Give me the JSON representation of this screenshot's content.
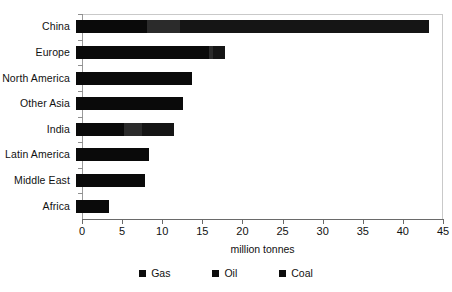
{
  "chart_data": {
    "type": "bar",
    "orientation": "horizontal",
    "stacked": true,
    "title": "",
    "xlabel": "million tonnes",
    "ylabel": "",
    "xlim": [
      0,
      45
    ],
    "xticks": [
      0,
      5,
      10,
      15,
      20,
      25,
      30,
      35,
      40,
      45
    ],
    "grid": false,
    "legend_position": "bottom",
    "categories": [
      "China",
      "Europe",
      "North America",
      "Other Asia",
      "India",
      "Latin America",
      "Middle East",
      "Africa"
    ],
    "series": [
      {
        "name": "Gas",
        "color": "#0a0a0a",
        "values": [
          8.8,
          16.6,
          14.5,
          13.4,
          6.0,
          9.1,
          8.6,
          4.1
        ]
      },
      {
        "name": "Oil",
        "color": "#2b2b2b",
        "values": [
          4.2,
          0.5,
          0.0,
          0.0,
          2.2,
          0.0,
          0.0,
          0.0
        ]
      },
      {
        "name": "Coal",
        "color": "#151515",
        "values": [
          31.0,
          1.5,
          0.0,
          0.0,
          4.0,
          0.0,
          0.0,
          0.0
        ]
      }
    ],
    "totals": [
      44.0,
      18.6,
      14.5,
      13.4,
      12.2,
      9.1,
      8.6,
      4.1
    ]
  },
  "axis": {
    "x_title": "million tonnes",
    "tick_labels": [
      "0",
      "5",
      "10",
      "15",
      "20",
      "25",
      "30",
      "35",
      "40",
      "45"
    ]
  },
  "categories": [
    {
      "label": "China"
    },
    {
      "label": "Europe"
    },
    {
      "label": "North America"
    },
    {
      "label": "Other Asia"
    },
    {
      "label": "India"
    },
    {
      "label": "Latin America"
    },
    {
      "label": "Middle East"
    },
    {
      "label": "Africa"
    }
  ],
  "legend": {
    "items": [
      {
        "label": "Gas",
        "color": "#0d0d0d"
      },
      {
        "label": "Oil",
        "color": "#0d0d0d"
      },
      {
        "label": "Coal",
        "color": "#0d0d0d"
      }
    ]
  }
}
